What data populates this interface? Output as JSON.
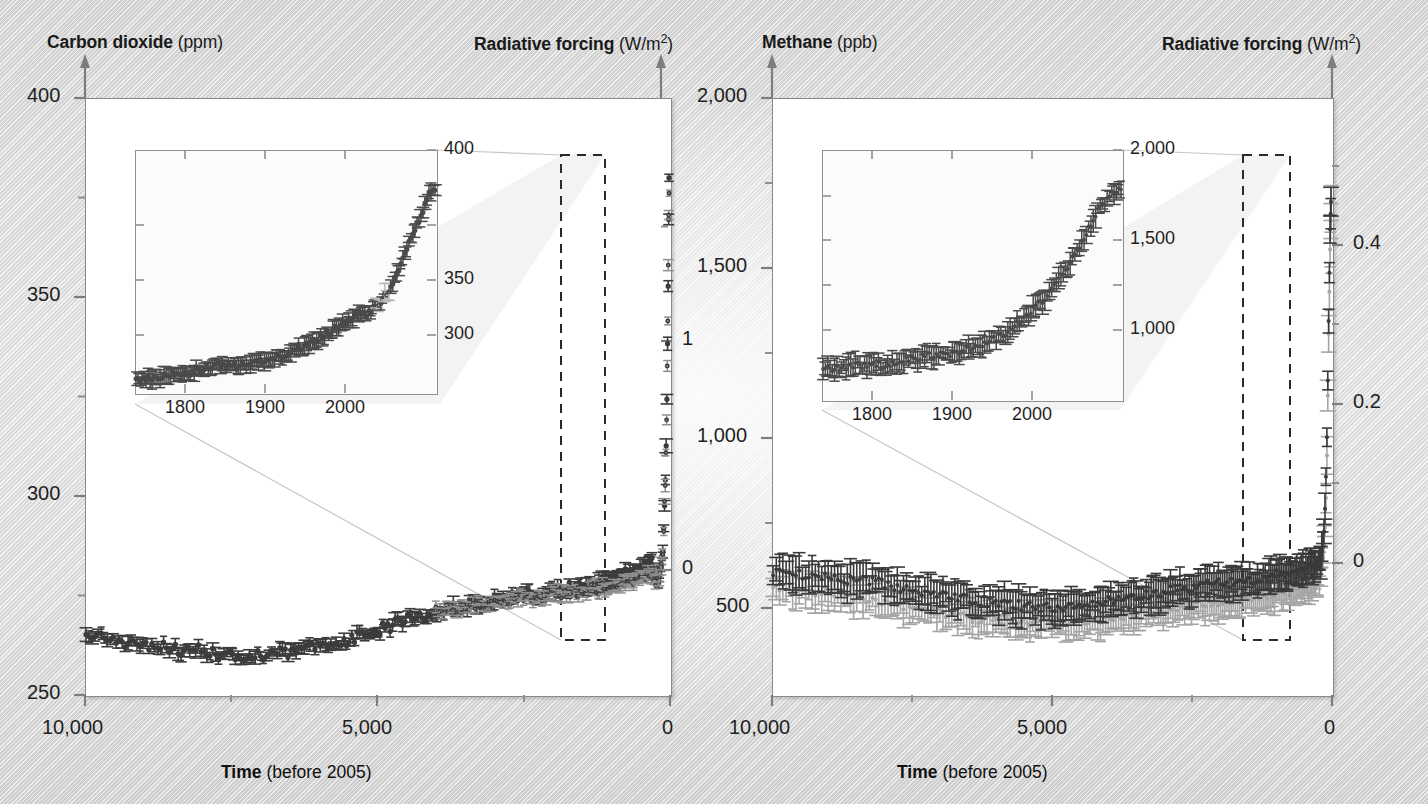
{
  "figure": {
    "background_color": "#e6e6e6",
    "panel_background": "#ffffff",
    "axis_color": "#7d7d7d"
  },
  "panels": [
    {
      "id": "co2",
      "left_axis_title_bold": "Carbon dioxide",
      "left_axis_title_unit": " (ppm)",
      "right_axis_title_bold": "Radiative forcing",
      "right_axis_title_unit": " (W/m2)",
      "x_axis_title_bold": "Time",
      "x_axis_title_unit": " (before 2005)",
      "y_ticks": [
        "400",
        "350",
        "300",
        "250"
      ],
      "y_minor_count": 3,
      "y_right_ticks": [
        "1",
        "0"
      ],
      "x_ticks": [
        "10,000",
        "5,000",
        "0"
      ],
      "inset": {
        "x_ticks": [
          "1800",
          "1900",
          "2000"
        ],
        "y_ticks": [
          "400",
          "350",
          "300"
        ]
      }
    },
    {
      "id": "ch4",
      "left_axis_title_bold": "Methane",
      "left_axis_title_unit": " (ppb)",
      "right_axis_title_bold": "Radiative forcing",
      "right_axis_title_unit": " (W/m2)",
      "x_axis_title_bold": "Time",
      "x_axis_title_unit": " (before 2005)",
      "y_ticks": [
        "2,000",
        "1,500",
        "1,000",
        "500"
      ],
      "y_minor_count": 3,
      "y_right_ticks": [
        "0.4",
        "0.2",
        "0"
      ],
      "x_ticks": [
        "10,000",
        "5,000",
        "0"
      ],
      "inset": {
        "x_ticks": [
          "1800",
          "1900",
          "2000"
        ],
        "y_ticks": [
          "2,000",
          "1,500",
          "1,000"
        ]
      }
    }
  ],
  "chart_data": {
    "type": "scatter",
    "title": "",
    "charts": [
      {
        "id": "co2",
        "type": "scatter",
        "ylabel": "Carbon dioxide (ppm)",
        "ylabel_right": "Radiative forcing (W/m2)",
        "xlabel": "Time (before 2005)",
        "xlim": [
          10000,
          0
        ],
        "xlim_note": "x decreases left to right (years before 2005)",
        "ylim": [
          250,
          400
        ],
        "yticks": [
          250,
          300,
          350,
          400
        ],
        "yticks_minor": [
          275,
          325,
          375
        ],
        "ylim_right": [
          -0.25,
          1.75
        ],
        "yticks_right": [
          0,
          1
        ],
        "yticks_right_minor": [
          0.5,
          1.5
        ],
        "xticks": [
          10000,
          5000,
          0
        ],
        "grid": false,
        "legend": "none",
        "series": [
          {
            "name": "CO2 ice core (main)",
            "color": "#3c3c3c",
            "x": [
              10000,
              9600,
              9200,
              8800,
              8400,
              8000,
              7600,
              7200,
              6800,
              6400,
              6000,
              5600,
              5200,
              4800,
              4400,
              4000,
              3600,
              3200,
              2800,
              2400,
              2000,
              1600,
              1200,
              1000,
              800,
              600,
              400,
              300,
              250,
              200,
              150,
              120,
              100,
              80,
              60,
              45,
              30,
              20,
              10,
              5,
              0
            ],
            "y": [
              265,
              264,
              263,
              262,
              261,
              261,
              260,
              260,
              260,
              261,
              262,
              263,
              265,
              267,
              269,
              270,
              272,
              273,
              274,
              275,
              276,
              277,
              278,
              279,
              280,
              281,
              282,
              283,
              281,
              279,
              280,
              284,
              289,
              296,
              306,
              316,
              331,
              345,
              360,
              370,
              379
            ]
          },
          {
            "name": "CO2 ice core (secondary, lighter)",
            "color": "#8f8f8f",
            "x": [
              4000,
              3500,
              3000,
              2500,
              2000,
              1500,
              1000,
              700,
              500,
              300,
              200,
              150,
              100,
              60,
              40,
              20,
              10,
              0
            ],
            "y": [
              271,
              272,
              273,
              274,
              275,
              276,
              277,
              278,
              279,
              280,
              278,
              280,
              287,
              305,
              320,
              345,
              362,
              377
            ]
          }
        ],
        "inset": {
          "xlim": [
            1750,
            2010
          ],
          "ylim": [
            270,
            400
          ],
          "xticks": [
            1800,
            1900,
            2000
          ],
          "yticks": [
            300,
            350,
            400
          ],
          "series": [
            {
              "name": "CO2 industrial era",
              "color": "#4a4a4a",
              "x": [
                1750,
                1760,
                1770,
                1780,
                1790,
                1800,
                1810,
                1820,
                1830,
                1840,
                1850,
                1860,
                1870,
                1880,
                1890,
                1900,
                1910,
                1920,
                1930,
                1940,
                1950,
                1960,
                1970,
                1980,
                1990,
                2000,
                2005
              ],
              "y": [
                277,
                277,
                278,
                279,
                280,
                281,
                283,
                284,
                284,
                285,
                286,
                287,
                288,
                290,
                293,
                296,
                299,
                303,
                307,
                311,
                312,
                317,
                325,
                339,
                354,
                369,
                379
              ]
            }
          ]
        },
        "annotations": [
          {
            "type": "dashed-box",
            "label": "zoom region",
            "x_range": [
              600,
              -150
            ],
            "y_range": [
              250,
              400
            ]
          }
        ]
      },
      {
        "id": "ch4",
        "type": "scatter",
        "ylabel": "Methane (ppb)",
        "ylabel_right": "Radiative forcing (W/m2)",
        "xlabel": "Time (before 2005)",
        "xlim": [
          10000,
          0
        ],
        "xlim_note": "x decreases left to right (years before 2005)",
        "ylim": [
          350,
          2050
        ],
        "yticks": [
          500,
          1000,
          1500,
          2000
        ],
        "yticks_minor": [
          750,
          1250,
          1750
        ],
        "ylim_right": [
          -0.08,
          0.56
        ],
        "yticks_right": [
          0,
          0.2,
          0.4
        ],
        "yticks_right_minor": [
          0.1,
          0.3,
          0.5
        ],
        "xticks": [
          10000,
          5000,
          0
        ],
        "grid": false,
        "legend": "none",
        "series": [
          {
            "name": "CH4 ice core (upper/darker band)",
            "color": "#3a3a3a",
            "x": [
              10000,
              9500,
              9000,
              8500,
              8000,
              7500,
              7000,
              6500,
              6000,
              5500,
              5000,
              4500,
              4000,
              3500,
              3000,
              2500,
              2000,
              1500,
              1000,
              700,
              500,
              300,
              200,
              150,
              100,
              70,
              50,
              30,
              15,
              5,
              0
            ],
            "y": [
              700,
              690,
              680,
              675,
              665,
              645,
              630,
              620,
              610,
              600,
              600,
              605,
              615,
              625,
              640,
              655,
              665,
              675,
              690,
              700,
              710,
              720,
              730,
              760,
              900,
              1100,
              1350,
              1550,
              1680,
              1740,
              1770
            ]
          },
          {
            "name": "CH4 ice core (lower/lighter band)",
            "color": "#a5a5a5",
            "x": [
              10000,
              9500,
              9000,
              8500,
              8000,
              7500,
              7000,
              6500,
              6000,
              5500,
              5000,
              4500,
              4000,
              3500,
              3000,
              2500,
              2000,
              1500,
              1000,
              700,
              500,
              300,
              200,
              150,
              100,
              70,
              50,
              30,
              15,
              5,
              0
            ],
            "y": [
              660,
              650,
              640,
              630,
              615,
              595,
              580,
              570,
              560,
              555,
              555,
              560,
              570,
              580,
              595,
              605,
              615,
              625,
              640,
              650,
              660,
              675,
              690,
              720,
              850,
              1040,
              1290,
              1500,
              1640,
              1710,
              1740
            ]
          }
        ],
        "inset": {
          "xlim": [
            1750,
            2010
          ],
          "ylim": [
            600,
            2000
          ],
          "xticks": [
            1800,
            1900,
            2000
          ],
          "yticks": [
            1000,
            1500,
            2000
          ],
          "series": [
            {
              "name": "CH4 industrial era",
              "color": "#4a4a4a",
              "x": [
                1750,
                1765,
                1780,
                1795,
                1810,
                1825,
                1840,
                1855,
                1870,
                1885,
                1900,
                1915,
                1930,
                1945,
                1960,
                1975,
                1990,
                2000,
                2005
              ],
              "y": [
                720,
                730,
                745,
                750,
                745,
                780,
                800,
                805,
                830,
                860,
                900,
                960,
                1050,
                1150,
                1280,
                1450,
                1650,
                1740,
                1770
              ]
            }
          ]
        },
        "annotations": [
          {
            "type": "dashed-box",
            "label": "zoom region",
            "x_range": [
              600,
              -150
            ],
            "y_range": [
              350,
              2050
            ]
          }
        ]
      }
    ]
  }
}
